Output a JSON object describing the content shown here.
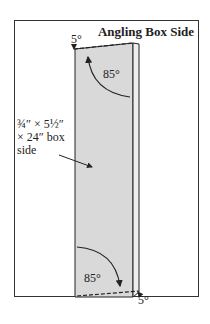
{
  "title": "Angling Box Side",
  "annotations": {
    "top_angle_small": "5°",
    "top_angle_large": "85°",
    "bottom_angle_large": "85°",
    "bottom_angle_small": "5°"
  },
  "callout": {
    "line1": "¾″ × 5½″",
    "line2": "× 24″ box",
    "line3": "side"
  },
  "colors": {
    "board_face": "#d9d9d9",
    "board_edge": "#eeeeee",
    "stroke": "#222222"
  }
}
